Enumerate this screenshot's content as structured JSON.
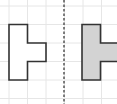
{
  "diagram": {
    "title": "",
    "grid": {
      "color": "#e6e6e6",
      "x_lines": [
        9,
        27.5,
        46,
        64.5,
        83,
        101.5
      ],
      "y_lines": [
        6,
        24.5,
        43,
        61.5,
        80,
        98.5
      ]
    },
    "mirror_line": {
      "x": 64,
      "color": "#555555",
      "style": "dashed"
    },
    "shapes": [
      {
        "name": "original-shape",
        "fill": "#ffffff",
        "stroke": "#333333",
        "points": "9,24.5 27.5,24.5 27.5,43 46,43 46,61.5 27.5,61.5 27.5,80 9,80"
      },
      {
        "name": "reflected-shape",
        "fill": "#d3d3d3",
        "stroke": "#333333",
        "points": "82,24.5 100.5,24.5 100.5,43 119,43 119,61.5 100.5,61.5 100.5,80 82,80"
      }
    ]
  }
}
